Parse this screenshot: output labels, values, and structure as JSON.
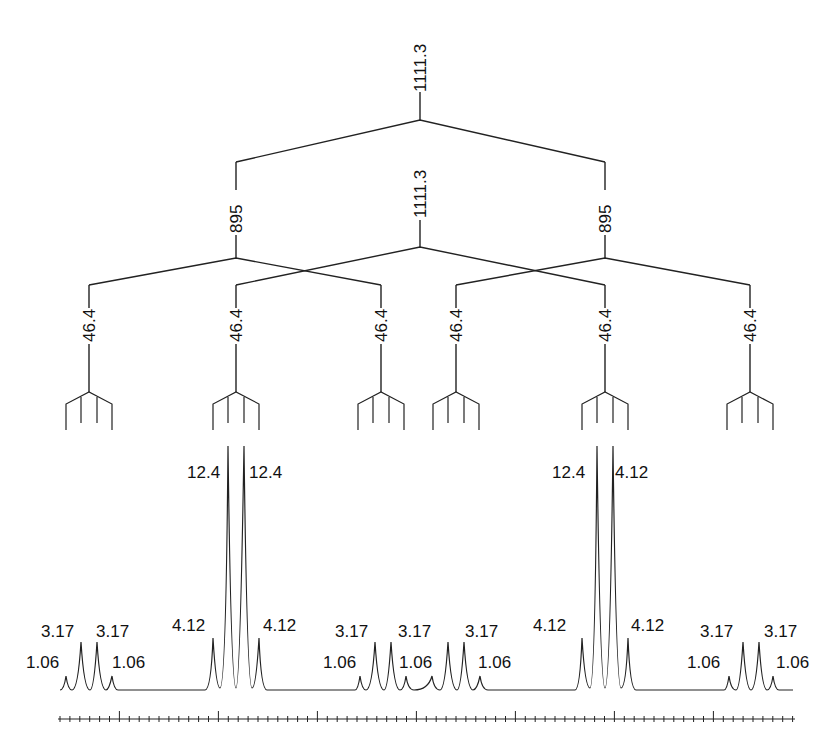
{
  "diagram": {
    "type": "nmr-splitting-tree",
    "levels": [
      {
        "coupling": "1111.3",
        "label": "1111.3"
      },
      {
        "coupling": "895",
        "labels": [
          "895",
          "1111.3",
          "895"
        ]
      },
      {
        "coupling": "46.4",
        "labels": [
          "46.4",
          "46.4",
          "46.4",
          "46.4",
          "46.4",
          "46.4"
        ]
      },
      {
        "multiplicity": "quartet",
        "count": 6
      }
    ],
    "spectrum": {
      "groups": [
        {
          "labels": [
            "1.06",
            "3.17",
            "3.17",
            "1.06"
          ]
        },
        {
          "labels": [
            "4.12",
            "12.4",
            "12.4",
            "4.12"
          ]
        },
        {
          "labels": [
            "1.06",
            "3.17",
            "3.17",
            "1.06"
          ]
        },
        {
          "labels": [
            "1.06",
            "3.17",
            "3.17",
            "1.06"
          ]
        },
        {
          "labels": [
            "4.12",
            "12.4",
            "12.4",
            "4.12"
          ]
        },
        {
          "labels": [
            "1.06",
            "3.17",
            "3.17",
            "1.06"
          ]
        }
      ],
      "peak_labels": {
        "g1_outer_left": "1.06",
        "g1_inner_left": "3.17",
        "g1_inner_right": "3.17",
        "g1_outer_right": "1.06",
        "g2_outer_left": "4.12",
        "g2_inner_left": "12.4",
        "g2_inner_right": "12.4",
        "g2_outer_right": "4.12",
        "g34_a": "1.06",
        "g34_b": "3.17",
        "g34_c": "3.17",
        "g34_d": "1.06",
        "g34_e": "3.17",
        "g34_f": "1.06",
        "g5_outer_left": "4.12",
        "g5_inner_left": "12.4",
        "g5_inner_right": "12.4",
        "g5_outer_right": "4.12",
        "g6_outer_left": "1.06",
        "g6_inner_left": "3.17",
        "g6_inner_right": "3.17",
        "g6_outer_right": "1.06"
      }
    },
    "scale_bar": {
      "major_ticks": 8,
      "minor_per_major": 10
    }
  }
}
